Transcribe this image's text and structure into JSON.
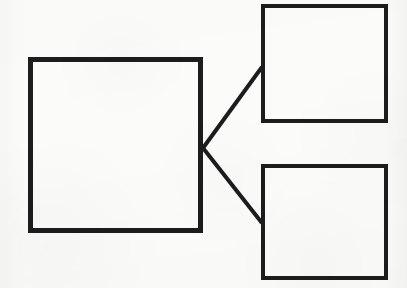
{
  "image": {
    "kind": "scanned-block-diagram",
    "width": 407,
    "height": 288,
    "background_color": "#fbfbfa",
    "ink_color": "#1d1d1d",
    "description": "Scanned line drawing: one large square on the left connected by two straight diagonal lines to two smaller squares stacked on the right."
  },
  "diagram": {
    "title": "",
    "shape_count": 3,
    "connector_count": 2,
    "nodes": [
      {
        "id": "node-main",
        "name": "large-left-box",
        "label": "",
        "shape": "rectangle",
        "x": 28,
        "y": 57,
        "width": 175,
        "height": 176,
        "stroke_width": 5,
        "stroke_color": "#1d1d1d",
        "fill_color": "none"
      },
      {
        "id": "node-top-right",
        "name": "small-top-right-box",
        "label": "",
        "shape": "rectangle",
        "x": 261,
        "y": 4,
        "width": 127,
        "height": 119,
        "stroke_width": 4,
        "stroke_color": "#1d1d1d",
        "fill_color": "none"
      },
      {
        "id": "node-bottom-right",
        "name": "small-bottom-right-box",
        "label": "",
        "shape": "rectangle",
        "x": 261,
        "y": 164,
        "width": 127,
        "height": 116,
        "stroke_width": 4,
        "stroke_color": "#1d1d1d",
        "fill_color": "none"
      }
    ],
    "connectors": [
      {
        "id": "connector-upper",
        "name": "connector-main-to-top-right",
        "from": "node-main",
        "to": "node-top-right",
        "x1": 203,
        "y1": 148,
        "x2": 262,
        "y2": 67,
        "stroke_width": 4,
        "stroke_color": "#1d1d1d",
        "arrowheads": false
      },
      {
        "id": "connector-lower",
        "name": "connector-main-to-bottom-right",
        "from": "node-main",
        "to": "node-bottom-right",
        "x1": 203,
        "y1": 148,
        "x2": 262,
        "y2": 223,
        "stroke_width": 4,
        "stroke_color": "#1d1d1d",
        "arrowheads": false
      }
    ],
    "junction": {
      "name": "connector-fan-junction",
      "x": 203,
      "y": 148
    }
  }
}
